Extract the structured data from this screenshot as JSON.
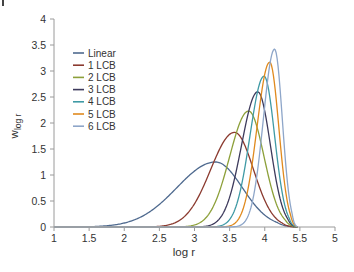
{
  "chart_data": {
    "type": "line",
    "title": "",
    "xlabel": "log r",
    "ylabel": "w",
    "ylabel_subscript": "log r",
    "xlim": [
      1,
      5
    ],
    "ylim": [
      0,
      4
    ],
    "grid": false,
    "legend_position": "upper-left",
    "x_ticks": [
      1,
      1.5,
      2,
      2.5,
      3,
      3.5,
      4,
      4.5,
      5
    ],
    "x_tick_labels": [
      "1",
      "1.5",
      "2",
      "2.5",
      "3",
      "3.5",
      "4",
      "5.5",
      "5"
    ],
    "y_ticks": [
      0,
      0.5,
      1,
      1.5,
      2,
      2.5,
      3,
      3.5,
      4
    ],
    "y_tick_labels": [
      "0",
      "0.5",
      "1",
      "1.5",
      "2",
      "2.5",
      "3",
      "3.5",
      "4"
    ],
    "series": [
      {
        "name": "Linear",
        "color": "#4f6a8f",
        "peak_x": 3.3,
        "peak_y": 1.25,
        "left_width": 0.55,
        "right_width": 0.38,
        "end_x": 4.47
      },
      {
        "name": "1 LCB",
        "color": "#8b3a2f",
        "peak_x": 3.57,
        "peak_y": 1.82,
        "left_width": 0.34,
        "right_width": 0.27,
        "end_x": 4.47
      },
      {
        "name": "2 LCB",
        "color": "#8da03a",
        "peak_x": 3.77,
        "peak_y": 2.23,
        "left_width": 0.27,
        "right_width": 0.22,
        "end_x": 4.47
      },
      {
        "name": "3 LCB",
        "color": "#3d3a5c",
        "peak_x": 3.9,
        "peak_y": 2.6,
        "left_width": 0.23,
        "right_width": 0.18,
        "end_x": 4.47
      },
      {
        "name": "4 LCB",
        "color": "#3f9aa5",
        "peak_x": 3.99,
        "peak_y": 2.9,
        "left_width": 0.2,
        "right_width": 0.15,
        "end_x": 4.47
      },
      {
        "name": "5 LCB",
        "color": "#e08a1e",
        "peak_x": 4.07,
        "peak_y": 3.17,
        "left_width": 0.18,
        "right_width": 0.13,
        "end_x": 4.47
      },
      {
        "name": "6 LCB",
        "color": "#8ea6c9",
        "peak_x": 4.14,
        "peak_y": 3.42,
        "left_width": 0.16,
        "right_width": 0.11,
        "end_x": 4.47
      }
    ]
  }
}
